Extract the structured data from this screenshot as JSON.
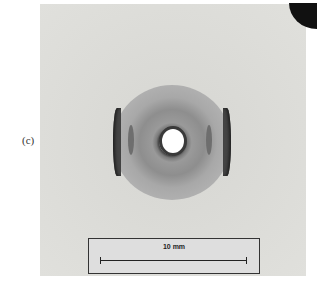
{
  "figure": {
    "panel_label": "(c)",
    "scale_bar": {
      "label": "10 mm"
    }
  }
}
